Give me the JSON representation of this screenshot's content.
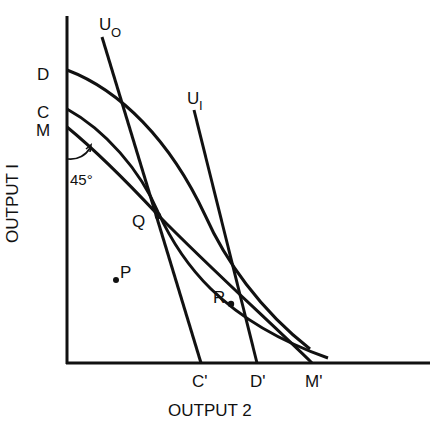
{
  "axes": {
    "y_label": "OUTPUT  I",
    "x_label": "OUTPUT  2"
  },
  "curve_labels": {
    "u0": "U",
    "u0_sub": "O",
    "u1": "U",
    "u1_sub": "I",
    "d": "D",
    "c": "C",
    "m": "M",
    "c_prime": "C'",
    "d_prime": "D'",
    "m_prime": "M'"
  },
  "points": {
    "q": "Q",
    "r": "R",
    "p": "P"
  },
  "angle_label": "45°"
}
